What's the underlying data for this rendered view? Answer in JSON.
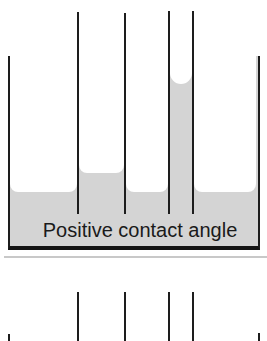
{
  "diagram": {
    "upper_panel": {
      "caption": "Positive contact angle"
    },
    "lower_panel": {
      "caption": ""
    },
    "colors": {
      "liquid": "#d4d4d4",
      "line": "#1d1d1d",
      "background": "#ffffff"
    }
  }
}
